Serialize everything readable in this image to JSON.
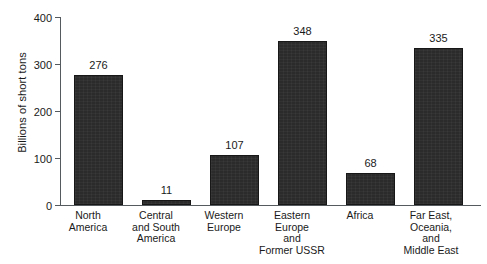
{
  "chart_data": {
    "type": "bar",
    "title": "",
    "subtitle": "",
    "xlabel": "",
    "ylabel": "Billions of short tons",
    "ylim": [
      0,
      400
    ],
    "yticks": [
      0,
      100,
      200,
      300,
      400
    ],
    "ytick_labels": [
      "0",
      "100",
      "200",
      "300",
      "400"
    ],
    "grid": false,
    "legend": null,
    "categories": [
      "North\nAmerica",
      "Central\nand South\nAmerica",
      "Western\nEurope",
      "Eastern\nEurope\nand\nFormer USSR",
      "Africa",
      "Far East,\nOceania,\nand\nMiddle East"
    ],
    "values": [
      276,
      11,
      107,
      348,
      68,
      335
    ],
    "value_labels": [
      "276",
      "11",
      "107",
      "348",
      "68",
      "335"
    ],
    "bar_color": "#2b2b2b",
    "bar_edge_color": "#171717",
    "axis_color": "#555a5e",
    "background_color": "#ffffff"
  }
}
